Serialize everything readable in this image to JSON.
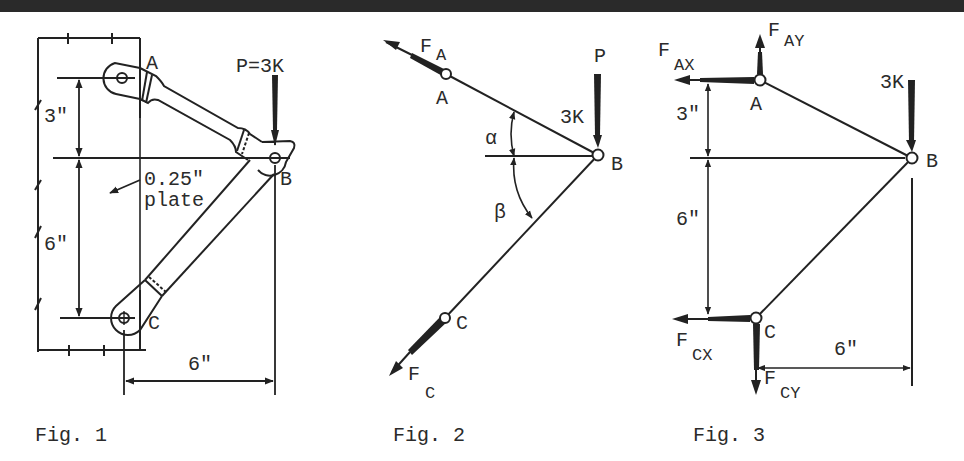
{
  "figures": [
    {
      "id": "fig1",
      "caption": "Fig. 1",
      "labels": {
        "joint_a": "A",
        "joint_b": "B",
        "joint_c": "C",
        "load": "P=3K",
        "dim_upper": "3\"",
        "dim_lower": "6\"",
        "dim_horizontal": "6\"",
        "plate_thickness": "0.25\"",
        "plate_word": "plate"
      }
    },
    {
      "id": "fig2",
      "caption": "Fig. 2",
      "labels": {
        "force_a": "F",
        "force_a_sub": "A",
        "force_c": "F",
        "force_c_sub": "C",
        "joint_a": "A",
        "joint_b": "B",
        "joint_c": "C",
        "load_symbol": "P",
        "load_value": "3K",
        "angle_alpha": "α",
        "angle_beta": "β"
      }
    },
    {
      "id": "fig3",
      "caption": "Fig. 3",
      "labels": {
        "force_ax": "F",
        "force_ax_sub": "AX",
        "force_ay": "F",
        "force_ay_sub": "AY",
        "force_cx": "F",
        "force_cx_sub": "CX",
        "force_cy": "F",
        "force_cy_sub": "CY",
        "joint_a": "A",
        "joint_b": "B",
        "joint_c": "C",
        "load_value": "3K",
        "dim_upper": "3\"",
        "dim_lower": "6\"",
        "dim_horizontal": "6\""
      }
    }
  ],
  "colors": {
    "ink": "#222222",
    "topbar": "#2a2a2a",
    "paper": "#ffffff"
  }
}
